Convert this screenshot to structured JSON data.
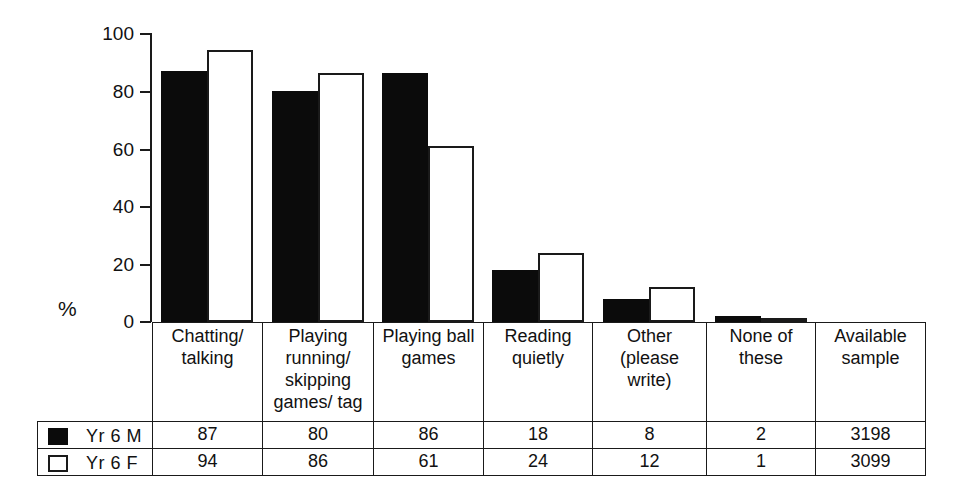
{
  "chart_data": {
    "type": "bar",
    "title": "",
    "xlabel": "",
    "ylabel": "%",
    "ylim": [
      0,
      100
    ],
    "yticks": [
      0,
      20,
      40,
      60,
      80,
      100
    ],
    "grid": false,
    "legend_position": "table-left",
    "categories": [
      "Chatting/ talking",
      "Playing running/ skipping games/ tag",
      "Playing ball games",
      "Reading quietly",
      "Other (please write)",
      "None of these",
      "Available sample"
    ],
    "series": [
      {
        "name": "Yr 6 M",
        "color": "#0b0b0b",
        "values": [
          87,
          80,
          86,
          18,
          8,
          2,
          3198
        ]
      },
      {
        "name": "Yr 6 F",
        "color": "#ffffff",
        "values": [
          94,
          86,
          61,
          24,
          12,
          1,
          3099
        ]
      }
    ]
  },
  "axis": {
    "percent_symbol": "%",
    "ticks": [
      "100",
      "80",
      "60",
      "40",
      "20",
      "0"
    ]
  },
  "table": {
    "category_labels": [
      [
        "Chatting/",
        "talking"
      ],
      [
        "Playing",
        "running/",
        "skipping",
        "games/ tag"
      ],
      [
        "Playing ball",
        "games"
      ],
      [
        "Reading",
        "quietly"
      ],
      [
        "Other",
        "(please",
        "write)"
      ],
      [
        "None of these"
      ],
      [
        "Available",
        "sample"
      ]
    ],
    "rows": [
      {
        "legend_swatch": "filled-square-icon",
        "label": "Yr 6 M",
        "values": [
          "87",
          "80",
          "86",
          "18",
          "8",
          "2",
          "3198"
        ]
      },
      {
        "legend_swatch": "hollow-square-icon",
        "label": "Yr 6 F",
        "values": [
          "94",
          "86",
          "61",
          "24",
          "12",
          "1",
          "3099"
        ]
      }
    ]
  }
}
